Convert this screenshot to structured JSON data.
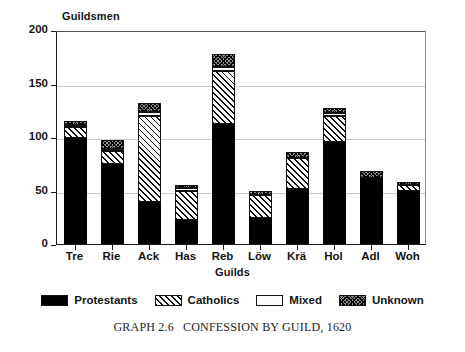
{
  "figure": {
    "caption_prefix": "GRAPH 2.6",
    "caption_text": "CONFESSION BY GUILD, 1620"
  },
  "chart_data": {
    "type": "bar",
    "title": "",
    "subtitle": "",
    "stacked": true,
    "xlabel": "Guilds",
    "ylabel": "Guildsmen",
    "ylim": [
      0,
      200
    ],
    "yticks": [
      0,
      50,
      100,
      150,
      200
    ],
    "grid": true,
    "legend_position": "bottom",
    "categories": [
      "Tre",
      "Rie",
      "Ack",
      "Has",
      "Reb",
      "Löw",
      "Krä",
      "Hol",
      "Adl",
      "Woh"
    ],
    "series": [
      {
        "name": "Protestants",
        "values": [
          99,
          75,
          39,
          22,
          112,
          24,
          51,
          95,
          62,
          50
        ]
      },
      {
        "name": "Catholics",
        "values": [
          10,
          12,
          81,
          28,
          50,
          22,
          29,
          25,
          0,
          5
        ]
      },
      {
        "name": "Mixed",
        "values": [
          2,
          2,
          3,
          2,
          3,
          0,
          0,
          2,
          0,
          0
        ]
      },
      {
        "name": "Unknown",
        "values": [
          4,
          8,
          9,
          3,
          13,
          4,
          6,
          5,
          6,
          3
        ]
      }
    ],
    "totals": [
      115,
      97,
      132,
      55,
      178,
      50,
      86,
      127,
      68,
      58
    ],
    "legend": [
      "Protestants",
      "Catholics",
      "Mixed",
      "Unknown"
    ],
    "colors": {
      "protestants": "#000000",
      "catholics": "#fbfbfb",
      "mixed": "#fcfcfc",
      "unknown": "#8d8d8d",
      "axis": "#1a1a1a",
      "grid": "#c9c9c9",
      "background": "#ffffff"
    }
  }
}
